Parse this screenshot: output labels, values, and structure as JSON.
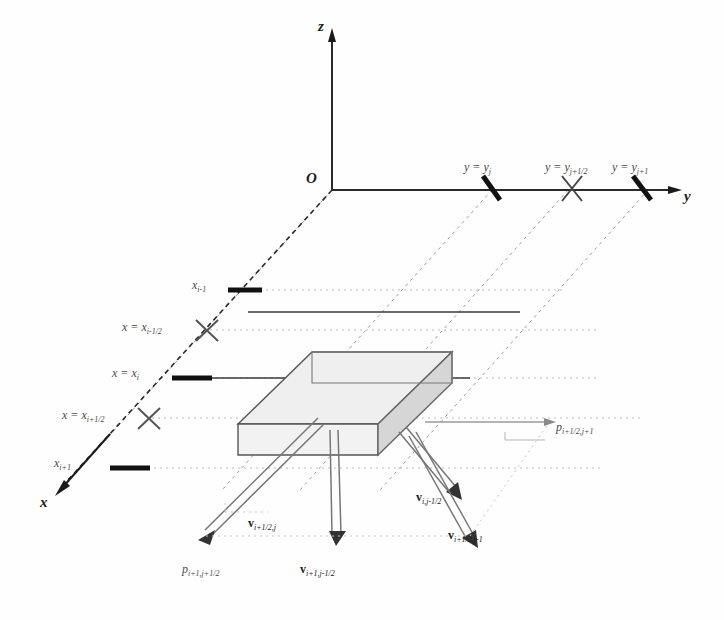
{
  "figure": {
    "type": "diagram",
    "background": "#fefefe",
    "ink": "#1a1a1a"
  },
  "axes": {
    "origin_label": "O",
    "z_label": "z",
    "y_label": "y",
    "x_label": "x"
  },
  "y_ticks": [
    {
      "label_main": "y = y",
      "label_sub": "j",
      "marker": "bar"
    },
    {
      "label_main": "y = y",
      "label_sub": "j+1/2",
      "marker": "cross"
    },
    {
      "label_main": "y = y",
      "label_sub": "j+1",
      "marker": "bar"
    }
  ],
  "x_ticks": [
    {
      "label_main": "x",
      "label_sub": "i-1",
      "marker": "bar"
    },
    {
      "label_main": "x = x",
      "label_sub": "i-1/2",
      "marker": "cross"
    },
    {
      "label_main": "x = x",
      "label_sub": "i",
      "marker": "bar"
    },
    {
      "label_main": "x = x",
      "label_sub": "i+1/2",
      "marker": "cross"
    },
    {
      "label_main": "x",
      "label_sub": "i+1",
      "marker": "bar"
    }
  ],
  "field_labels": [
    {
      "name": "pressure-right",
      "symbol": "p",
      "sub": "i+1/2,j+1",
      "bold": false
    },
    {
      "name": "velocity-center-bottom",
      "symbol": "v",
      "sub": "i+1/2,j",
      "bold": true
    },
    {
      "name": "velocity-right-upper",
      "symbol": "v",
      "sub": "i,j-1/2",
      "bold": true
    },
    {
      "name": "velocity-right-lower",
      "symbol": "v",
      "sub": "i+1/2,j-1",
      "bold": true
    },
    {
      "name": "pressure-bottom-left",
      "symbol": "p",
      "sub": "i+1,j+1/2",
      "bold": false
    },
    {
      "name": "velocity-bottom-center",
      "symbol": "v",
      "sub": "i+1,j-1/2",
      "bold": true
    }
  ],
  "colors": {
    "cell_top_face": "#eeeeee",
    "cell_side_face": "#d8d8d8",
    "cell_front_face": "#f0f0f0",
    "stroke": "#4a4a4a",
    "dashed_guide": "#b9b9b9"
  }
}
